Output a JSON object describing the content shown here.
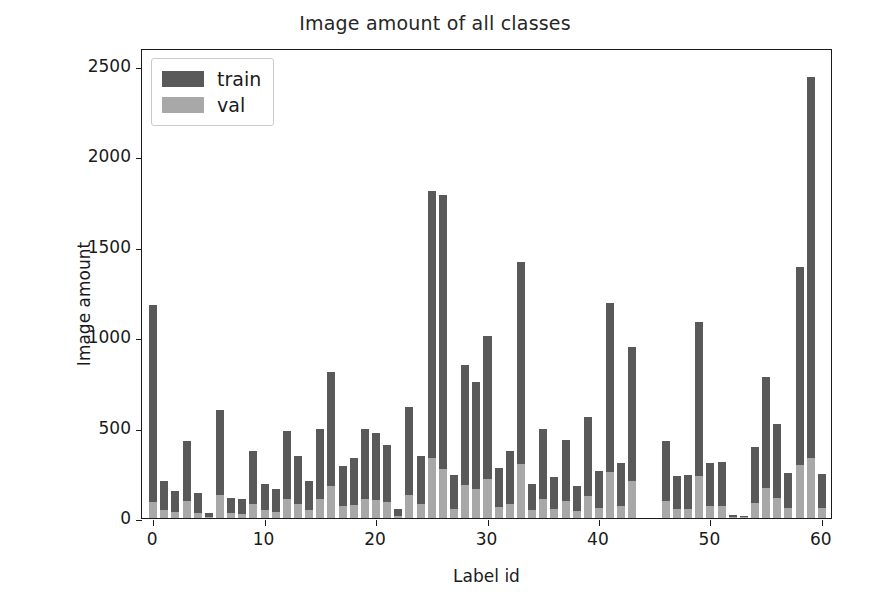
{
  "chart_data": {
    "type": "bar",
    "title": "Image amount of all classes",
    "xlabel": "Label id",
    "ylabel": "Image amount",
    "xlim": [
      -1,
      61
    ],
    "ylim": [
      0,
      2600
    ],
    "xticks": [
      0,
      10,
      20,
      30,
      40,
      50,
      60
    ],
    "yticks": [
      0,
      500,
      1000,
      1500,
      2000,
      2500
    ],
    "grid": false,
    "legend_position": "upper left",
    "bar_style": "overlaid",
    "colors": {
      "train": "#595959",
      "val": "#a8a8a8",
      "axis": "#1a1a1a",
      "background": "#ffffff"
    },
    "categories": [
      0,
      1,
      2,
      3,
      4,
      5,
      6,
      7,
      8,
      9,
      10,
      11,
      12,
      13,
      14,
      15,
      16,
      17,
      18,
      19,
      20,
      21,
      22,
      23,
      24,
      25,
      26,
      27,
      28,
      29,
      30,
      31,
      32,
      33,
      34,
      35,
      36,
      37,
      38,
      39,
      40,
      41,
      42,
      43,
      44,
      45,
      46,
      47,
      48,
      49,
      50,
      51,
      52,
      53,
      54,
      55,
      56,
      57,
      58,
      59,
      60
    ],
    "series": [
      {
        "name": "train",
        "values": [
          1180,
          205,
          150,
          425,
          140,
          30,
          595,
          110,
          105,
          370,
          190,
          160,
          480,
          345,
          205,
          490,
          810,
          290,
          330,
          490,
          470,
          405,
          50,
          615,
          345,
          1810,
          1785,
          240,
          845,
          755,
          1005,
          275,
          370,
          1415,
          190,
          495,
          225,
          430,
          175,
          560,
          260,
          1190,
          305,
          945,
          0,
          0,
          425,
          230,
          240,
          1085,
          305,
          310,
          15,
          10,
          395,
          780,
          520,
          250,
          1390,
          2440,
          245
        ]
      },
      {
        "name": "val",
        "values": [
          90,
          45,
          35,
          95,
          30,
          8,
          130,
          25,
          22,
          80,
          42,
          35,
          105,
          75,
          45,
          105,
          175,
          65,
          72,
          105,
          100,
          88,
          12,
          130,
          75,
          330,
          270,
          52,
          185,
          160,
          215,
          60,
          80,
          300,
          42,
          105,
          50,
          92,
          38,
          120,
          57,
          255,
          65,
          205,
          0,
          0,
          92,
          50,
          52,
          235,
          66,
          67,
          4,
          3,
          85,
          165,
          112,
          55,
          295,
          330,
          53
        ]
      }
    ]
  },
  "legend": {
    "entries": [
      {
        "label": "train",
        "color": "#595959"
      },
      {
        "label": "val",
        "color": "#a8a8a8"
      }
    ]
  }
}
